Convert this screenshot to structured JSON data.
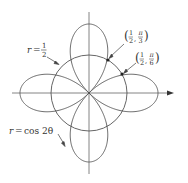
{
  "figure": {
    "curves": [
      {
        "name": "rose",
        "equation": "r = cos 2θ",
        "label_lhs": "r",
        "label_eq": "=",
        "label_rhs": "cos 2θ"
      },
      {
        "name": "circle",
        "equation": "r = 1/2",
        "label_lhs": "r",
        "label_eq": "=",
        "label_num": "1",
        "label_den": "2"
      }
    ],
    "points": [
      {
        "label": "(1/2, π/3)",
        "r_num": "1",
        "r_den": "2",
        "theta_num": "π",
        "theta_den": "3"
      },
      {
        "label": "(1/2, π/6)",
        "r_num": "1",
        "r_den": "2",
        "theta_num": "π",
        "theta_den": "6"
      }
    ],
    "colors": {
      "curve": "#555555",
      "axis": "#666666",
      "text": "#333333",
      "background": "#ffffff"
    }
  }
}
